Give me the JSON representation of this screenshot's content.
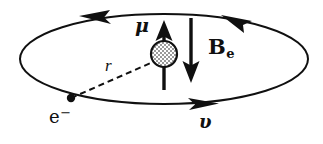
{
  "figure": {
    "caption": "Electron orbit with nuclear magnetic moment and internal magnetic field",
    "background_color": "#ffffff",
    "ink_color": "#101010"
  },
  "orbit": {
    "name": "electron-orbit-ellipse",
    "shape": "ellipse",
    "center_x": 164,
    "center_y": 59,
    "radius_x": 144,
    "radius_y": 45,
    "stroke_width": 2.0,
    "direction": "counterclockwise",
    "arrowheads": [
      {
        "name": "orbit-arrowhead-top-left",
        "x": 96,
        "y": 16,
        "angle_deg": 196
      },
      {
        "name": "orbit-arrowhead-top-right",
        "x": 237,
        "y": 18,
        "angle_deg": 200
      },
      {
        "name": "orbit-arrowhead-bottom-right",
        "x": 204,
        "y": 103,
        "angle_deg": 14
      }
    ]
  },
  "nucleus": {
    "name": "nucleus-circle",
    "center_x": 164,
    "center_y": 54,
    "radius": 13,
    "fill_pattern": "stippled-checkered",
    "fill_color": "#b8b8b8",
    "stroke_width": 2.2
  },
  "moment_arrow": {
    "name": "magnetic-moment-arrow",
    "label": "μ",
    "direction": "up",
    "x": 164,
    "tail_y": 90,
    "tip_y": 21,
    "stroke_width": 3.4
  },
  "field_arrow": {
    "name": "magnetic-field-arrow",
    "label": "B",
    "subscript": "e",
    "direction": "down",
    "x": 191,
    "tail_y": 18,
    "tip_y": 82,
    "stroke_width": 3.4
  },
  "radius_line": {
    "name": "orbit-radius-dashed-line",
    "label": "r",
    "x1": 71,
    "y1": 98,
    "x2": 153,
    "y2": 62,
    "dash": "6 4",
    "stroke_width": 2.0
  },
  "electron": {
    "name": "electron-point",
    "label": "e",
    "superscript": "−",
    "x": 71,
    "y": 98,
    "radius": 4.2
  },
  "velocity": {
    "name": "velocity-label",
    "label": "υ"
  }
}
